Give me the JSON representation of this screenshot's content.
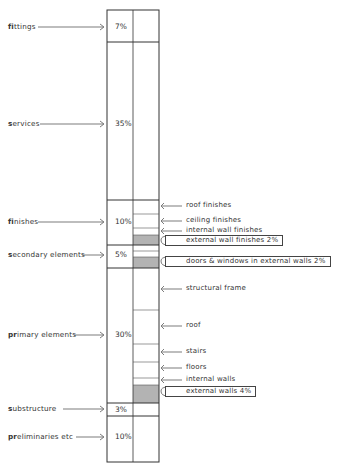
{
  "diagram": {
    "type": "stacked-column-cost-breakdown",
    "colors": {
      "line": "#333333",
      "shade": "#b3b3b3",
      "background": "#ffffff"
    },
    "main_elements": [
      {
        "bold_prefix": "fi",
        "label": "fittings",
        "display": "fittings",
        "percent": "7%",
        "label_y": 27
      },
      {
        "bold_prefix": "s",
        "label": "services",
        "display": "services",
        "percent": "35%",
        "label_y": 124
      },
      {
        "bold_prefix": "fi",
        "label": "finishes",
        "display": "finishes",
        "percent": "10%",
        "label_y": 222
      },
      {
        "bold_prefix": "s",
        "label": "secondary elements",
        "display": "secondary elements",
        "percent": "5%",
        "label_y": 255
      },
      {
        "bold_prefix": "pr",
        "label": "primary elements",
        "display": "primary elements",
        "percent": "30%",
        "label_y": 335
      },
      {
        "bold_prefix": "s",
        "label": "substructure",
        "display": "substructure",
        "percent": "3%",
        "label_y": 409
      },
      {
        "bold_prefix": "pr",
        "label": "preliminaries etc",
        "display": "preliminaries etc",
        "percent": "10%",
        "label_y": 437
      }
    ],
    "sub_elements": [
      {
        "label": "roof finishes",
        "group": "finishes",
        "highlighted": false
      },
      {
        "label": "ceiling finishes",
        "group": "finishes",
        "highlighted": false
      },
      {
        "label": "internal wall finishes",
        "group": "finishes",
        "highlighted": false
      },
      {
        "label": "external wall finishes 2%",
        "group": "finishes",
        "highlighted": true
      },
      {
        "label": "doors & windows in external walls 2%",
        "group": "secondary elements",
        "highlighted": true
      },
      {
        "label": "structural frame",
        "group": "primary elements",
        "highlighted": false
      },
      {
        "label": "roof",
        "group": "primary elements",
        "highlighted": false
      },
      {
        "label": "stairs",
        "group": "primary elements",
        "highlighted": false
      },
      {
        "label": "floors",
        "group": "primary elements",
        "highlighted": false
      },
      {
        "label": "internal walls",
        "group": "primary elements",
        "highlighted": false
      },
      {
        "label": "external walls 4%",
        "group": "primary elements",
        "highlighted": true
      }
    ]
  }
}
